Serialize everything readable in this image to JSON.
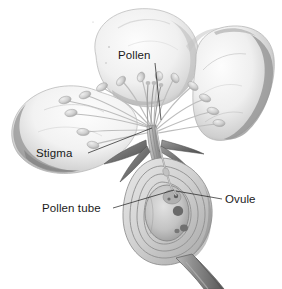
{
  "figure": {
    "background_color": "#ffffff",
    "style": "grayscale pencil/airbrush botanical illustration",
    "width": 282,
    "height": 289
  },
  "labels": [
    {
      "id": "pollen",
      "text": "Pollen",
      "text_x": 118,
      "text_y": 59,
      "anchor": "start",
      "leader_path": "M 155 63 L 161 120",
      "points_to": "anther cluster at top of stamens"
    },
    {
      "id": "stigma",
      "text": "Stigma",
      "text_x": 36,
      "text_y": 157,
      "anchor": "start",
      "leader_path": "M 88 153 L 152 128",
      "points_to": "style and stigma bundle at flower center"
    },
    {
      "id": "pollen-tube",
      "text": "Pollen tube",
      "text_x": 42,
      "text_y": 212,
      "anchor": "start",
      "leader_path": "M 113 208 L 174 190",
      "points_to": "tube descending through style into ovule"
    },
    {
      "id": "ovule",
      "text": "Ovule",
      "text_x": 225,
      "text_y": 203,
      "anchor": "start",
      "leader_path": "M 222 199 L 176 191",
      "points_to": "ovule inside ovary chamber"
    }
  ],
  "parts": {
    "petals": [
      {
        "name": "top-petal",
        "position": "upper center-left"
      },
      {
        "name": "left-petal",
        "position": "mid left"
      },
      {
        "name": "right-petal",
        "position": "upper right"
      }
    ],
    "stamens": {
      "count": 14,
      "description": "filaments radiating outward with oval anthers at tips"
    },
    "sepals": {
      "count": 4,
      "description": "dark curved sepals below the receptacle"
    },
    "ovary": {
      "description": "oval cross-section with concentric wall layers"
    },
    "ovule_body": {
      "description": "inner chamber with dark nucleus and small dark bodies"
    },
    "pedicel": {
      "description": "thick stem curving down to lower right"
    }
  },
  "colors": {
    "background": "#ffffff",
    "ink": "#1a1a1a",
    "petal_light": "#fbfbfb",
    "petal_mid": "#e4e4e4",
    "petal_shadow": "#9a9a9a",
    "petal_deep_shadow": "#6f6f6f",
    "stamen": "#cfcfcf",
    "anther": "#c4c4c4",
    "sepal_dark": "#6a6a6a",
    "ovary_wall": "#bdbdbd",
    "ovary_fill": "#d8d8d8",
    "ovule_dark": "#5a5a5a",
    "stem": "#8d8d8d"
  }
}
